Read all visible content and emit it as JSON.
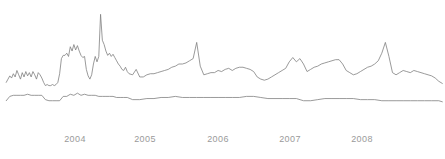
{
  "chart_data": {
    "type": "line",
    "title": "",
    "subtitle": "",
    "xlabel": "",
    "ylabel": "",
    "grid": false,
    "legend": "none",
    "background_color": "#ffffff",
    "axis_label_color": "#9a9a9a",
    "xlim": [
      2003.55,
      2008.55
    ],
    "ylim": [
      0,
      100
    ],
    "x_tick_labels": [
      "2004",
      "2005",
      "2006",
      "2007",
      "2008"
    ],
    "x_tick_values": [
      2004,
      2005,
      2006,
      2007,
      2008
    ],
    "x_tick_pixels": [
      75,
      145,
      218,
      290,
      362
    ],
    "y_tick_labels": [],
    "series": [
      {
        "name": "upper-series",
        "color": "#808080",
        "x": [
          2003.62,
          2003.64,
          2003.66,
          2003.68,
          2003.7,
          2003.72,
          2003.74,
          2003.76,
          2003.78,
          2003.8,
          2003.82,
          2003.84,
          2003.86,
          2003.88,
          2003.9,
          2003.92,
          2003.94,
          2003.96,
          2003.98,
          2004.0,
          2004.02,
          2004.04,
          2004.06,
          2004.08,
          2004.1,
          2004.12,
          2004.14,
          2004.16,
          2004.18,
          2004.2,
          2004.22,
          2004.24,
          2004.26,
          2004.28,
          2004.3,
          2004.32,
          2004.34,
          2004.36,
          2004.38,
          2004.4,
          2004.42,
          2004.44,
          2004.46,
          2004.48,
          2004.5,
          2004.52,
          2004.54,
          2004.56,
          2004.58,
          2004.6,
          2004.62,
          2004.64,
          2004.66,
          2004.68,
          2004.7,
          2004.72,
          2004.74,
          2004.76,
          2004.78,
          2004.8,
          2004.82,
          2004.84,
          2004.86,
          2004.88,
          2004.9,
          2004.92,
          2004.94,
          2004.96,
          2004.98,
          2005.0,
          2005.04,
          2005.08,
          2005.12,
          2005.16,
          2005.2,
          2005.24,
          2005.28,
          2005.32,
          2005.36,
          2005.4,
          2005.44,
          2005.48,
          2005.52,
          2005.56,
          2005.6,
          2005.64,
          2005.68,
          2005.72,
          2005.76,
          2005.8,
          2005.84,
          2005.88,
          2005.92,
          2005.96,
          2006.0,
          2006.04,
          2006.08,
          2006.12,
          2006.16,
          2006.2,
          2006.24,
          2006.28,
          2006.32,
          2006.36,
          2006.4,
          2006.44,
          2006.48,
          2006.52,
          2006.56,
          2006.6,
          2006.64,
          2006.68,
          2006.72,
          2006.76,
          2006.8,
          2006.84,
          2006.88,
          2006.92,
          2006.96,
          2007.0,
          2007.04,
          2007.08,
          2007.12,
          2007.16,
          2007.2,
          2007.24,
          2007.28,
          2007.32,
          2007.36,
          2007.4,
          2007.44,
          2007.48,
          2007.52,
          2007.56,
          2007.6,
          2007.64,
          2007.68,
          2007.72,
          2007.76,
          2007.8,
          2007.84,
          2007.88,
          2007.92,
          2007.96,
          2008.0,
          2008.04,
          2008.08,
          2008.12,
          2008.16,
          2008.2,
          2008.24,
          2008.28,
          2008.32,
          2008.36,
          2008.4,
          2008.44,
          2008.48,
          2008.52
        ],
        "values": [
          33,
          36,
          39,
          37,
          41,
          38,
          44,
          40,
          36,
          42,
          38,
          43,
          39,
          42,
          38,
          43,
          40,
          36,
          42,
          40,
          37,
          33,
          30,
          31,
          30,
          30,
          31,
          30,
          31,
          33,
          41,
          55,
          58,
          58,
          60,
          57,
          66,
          62,
          68,
          63,
          67,
          62,
          58,
          56,
          57,
          45,
          39,
          36,
          40,
          50,
          57,
          52,
          57,
          96,
          72,
          68,
          62,
          58,
          60,
          57,
          59,
          56,
          53,
          50,
          48,
          45,
          44,
          47,
          43,
          41,
          40,
          45,
          38,
          38,
          40,
          41,
          41,
          42,
          43,
          44,
          45,
          47,
          48,
          50,
          50,
          51,
          53,
          55,
          70,
          48,
          40,
          41,
          42,
          42,
          44,
          43,
          45,
          46,
          44,
          46,
          47,
          47,
          46,
          45,
          43,
          38,
          36,
          35,
          36,
          38,
          40,
          42,
          44,
          46,
          52,
          56,
          52,
          55,
          50,
          43,
          45,
          47,
          48,
          50,
          51,
          52,
          53,
          54,
          54,
          50,
          44,
          42,
          40,
          41,
          43,
          45,
          47,
          48,
          50,
          53,
          60,
          70,
          57,
          42,
          40,
          42,
          44,
          43,
          42,
          44,
          43,
          42,
          41,
          40,
          39,
          37,
          34,
          32
        ]
      },
      {
        "name": "lower-series",
        "color": "#808080",
        "x": [
          2003.62,
          2003.66,
          2003.7,
          2003.74,
          2003.78,
          2003.82,
          2003.86,
          2003.9,
          2003.94,
          2003.98,
          2004.02,
          2004.06,
          2004.1,
          2004.14,
          2004.18,
          2004.22,
          2004.26,
          2004.3,
          2004.34,
          2004.38,
          2004.42,
          2004.46,
          2004.5,
          2004.54,
          2004.58,
          2004.62,
          2004.66,
          2004.7,
          2004.74,
          2004.78,
          2004.82,
          2004.86,
          2004.9,
          2004.94,
          2004.98,
          2005.04,
          2005.12,
          2005.2,
          2005.28,
          2005.36,
          2005.44,
          2005.52,
          2005.6,
          2005.68,
          2005.76,
          2005.84,
          2005.92,
          2006.0,
          2006.08,
          2006.16,
          2006.24,
          2006.32,
          2006.4,
          2006.48,
          2006.56,
          2006.64,
          2006.72,
          2006.8,
          2006.88,
          2006.96,
          2007.04,
          2007.12,
          2007.2,
          2007.28,
          2007.36,
          2007.44,
          2007.52,
          2007.6,
          2007.68,
          2007.76,
          2007.84,
          2007.92,
          2008.0,
          2008.08,
          2008.16,
          2008.24,
          2008.32,
          2008.4,
          2008.48,
          2008.52
        ],
        "values": [
          16,
          20,
          21,
          21,
          21,
          21,
          22,
          21,
          21,
          21,
          21,
          17,
          16,
          16,
          16,
          16,
          20,
          20,
          22,
          21,
          23,
          21,
          22,
          21,
          21,
          21,
          20,
          20,
          20,
          20,
          20,
          19,
          19,
          19,
          19,
          17,
          17,
          18,
          18,
          19,
          19,
          20,
          19,
          19,
          19,
          19,
          19,
          19,
          19,
          19,
          19,
          20,
          20,
          19,
          18,
          18,
          18,
          18,
          18,
          16,
          16,
          17,
          18,
          18,
          18,
          18,
          18,
          17,
          17,
          17,
          16,
          16,
          16,
          16,
          16,
          16,
          16,
          16,
          16,
          15
        ]
      }
    ]
  }
}
